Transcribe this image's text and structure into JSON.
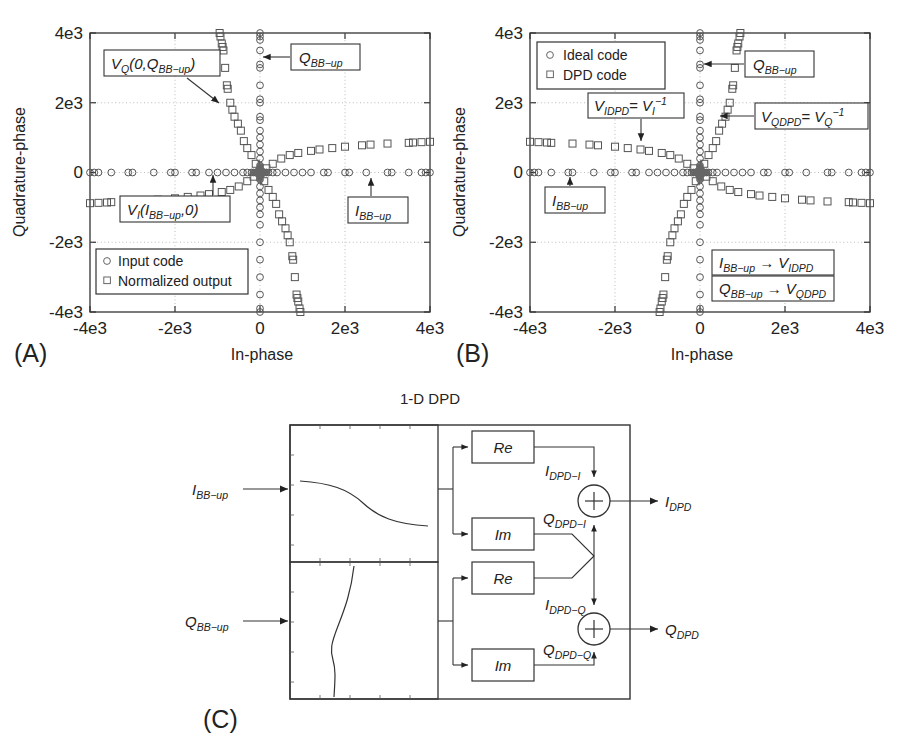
{
  "figure": {
    "background": "#ffffff",
    "line_color": "#333333",
    "marker_color": "#555555",
    "cluster_color": "#666666"
  },
  "panelA": {
    "label": "(A)",
    "xlabel": "In-phase",
    "ylabel": "Quadrature-phase",
    "xticks": [
      "-4e3",
      "-2e3",
      "0",
      "2e3",
      "4e3"
    ],
    "yticks": [
      "4e3",
      "2e3",
      "0",
      "-2e3",
      "-4e3"
    ],
    "legend": [
      {
        "marker": "circle",
        "label": "Input code"
      },
      {
        "marker": "square",
        "label": "Normalized output"
      }
    ],
    "annotations": [
      {
        "name": "vq-annotation",
        "text_parts": [
          "V",
          "Q",
          "(0,Q",
          "BB−up",
          ")"
        ]
      },
      {
        "name": "qbbup-annotation",
        "text_parts": [
          "Q",
          "BB−up"
        ]
      },
      {
        "name": "vi-annotation",
        "text_parts": [
          "V",
          "I",
          "(I",
          "BB−up",
          ",0)"
        ]
      },
      {
        "name": "ibbup-annotation",
        "text_parts": [
          "I",
          "BB−up"
        ]
      }
    ]
  },
  "panelB": {
    "label": "(B)",
    "xlabel": "In-phase",
    "ylabel": "Quadrature-phase",
    "xticks": [
      "-4e3",
      "-2e3",
      "0",
      "2e3",
      "4e3"
    ],
    "yticks": [
      "4e3",
      "2e3",
      "0",
      "-2e3",
      "-4e3"
    ],
    "legend": [
      {
        "marker": "circle",
        "label": "Ideal code"
      },
      {
        "marker": "square",
        "label": "DPD code"
      }
    ],
    "annotations": [
      {
        "name": "qbbup-annotation",
        "text_parts": [
          "Q",
          "BB−up"
        ]
      },
      {
        "name": "vidpd-annotation",
        "text_parts": [
          "V",
          "IDPD",
          " = V",
          "I",
          "−1"
        ]
      },
      {
        "name": "vqdpd-annotation",
        "text_parts": [
          "V",
          "QDPD",
          " = V",
          "Q",
          "−1"
        ]
      },
      {
        "name": "ibbup-annotation",
        "text_parts": [
          "I",
          "BB−up"
        ]
      },
      {
        "name": "map-i-annotation",
        "text_parts": [
          "I",
          "BB−up",
          " → V",
          "IDPD"
        ]
      },
      {
        "name": "map-q-annotation",
        "text_parts": [
          "Q",
          "BB−up",
          " → V",
          "QDPD"
        ]
      }
    ]
  },
  "panelC": {
    "label": "(C)",
    "title": "1-D DPD",
    "inputs": [
      {
        "name": "input-i",
        "base": "I",
        "sub": "BB−up"
      },
      {
        "name": "input-q",
        "base": "Q",
        "sub": "BB−up"
      }
    ],
    "blocks": [
      {
        "name": "re-block-1",
        "label": "Re"
      },
      {
        "name": "im-block-1",
        "label": "Im"
      },
      {
        "name": "re-block-2",
        "label": "Re"
      },
      {
        "name": "im-block-2",
        "label": "Im"
      }
    ],
    "wire_labels": [
      {
        "name": "wire-idpd-i",
        "base": "I",
        "sub": "DPD−I"
      },
      {
        "name": "wire-qdpd-i",
        "base": "Q",
        "sub": "DPD−I"
      },
      {
        "name": "wire-idpd-q",
        "base": "I",
        "sub": "DPD−Q"
      },
      {
        "name": "wire-qdpd-q",
        "base": "Q",
        "sub": "DPD−Q"
      }
    ],
    "adders": [
      {
        "name": "adder-i",
        "symbol": "+"
      },
      {
        "name": "adder-q",
        "symbol": "+"
      }
    ],
    "outputs": [
      {
        "name": "output-i",
        "base": "I",
        "sub": "DPD"
      },
      {
        "name": "output-q",
        "base": "Q",
        "sub": "DPD"
      }
    ]
  },
  "chart_data": [
    {
      "type": "scatter",
      "panel": "A",
      "title": "",
      "xlabel": "In-phase",
      "ylabel": "Quadrature-phase",
      "xlim": [
        -4000,
        4000
      ],
      "ylim": [
        -4000,
        4000
      ],
      "grid": true,
      "legend_position": "lower-left",
      "series": [
        {
          "name": "Input code",
          "marker": "circle",
          "description": "Ideal constellation codes lying exactly on the I axis (y=0) and on the Q axis (x=0), plus a dense cluster at the origin.",
          "x": [
            -4000,
            -3900,
            -3800,
            -3500,
            -3100,
            -3000,
            -2500,
            -2100,
            -2000,
            -1600,
            -1500,
            -1200,
            -1000,
            -800,
            -600,
            -400,
            -300,
            -200,
            -150,
            -100,
            -60,
            -30,
            0,
            30,
            60,
            100,
            150,
            200,
            300,
            400,
            600,
            800,
            1000,
            1200,
            1500,
            1600,
            2000,
            2100,
            2500,
            3000,
            3100,
            3500,
            3800,
            3900,
            4000
          ],
          "y": [
            0,
            0,
            0,
            0,
            0,
            0,
            0,
            0,
            0,
            0,
            0,
            0,
            0,
            0,
            0,
            0,
            0,
            0,
            0,
            0,
            0,
            0,
            0,
            0,
            0,
            0,
            0,
            0,
            0,
            0,
            0,
            0,
            0,
            0,
            0,
            0,
            0,
            0,
            0,
            0,
            0,
            0,
            0,
            0,
            0
          ]
        },
        {
          "name": "Input code (Q axis)",
          "marker": "circle",
          "x": [
            0,
            0,
            0,
            0,
            0,
            0,
            0,
            0,
            0,
            0,
            0,
            0,
            0,
            0,
            0,
            0,
            0,
            0,
            0,
            0,
            0,
            0,
            0,
            0,
            0,
            0,
            0,
            0,
            0,
            0,
            0,
            0
          ],
          "y": [
            4000,
            3900,
            3800,
            3500,
            3100,
            3000,
            2500,
            2100,
            2000,
            1600,
            1500,
            1200,
            1000,
            800,
            600,
            400,
            200,
            100,
            -100,
            -200,
            -400,
            -600,
            -800,
            -1000,
            -1200,
            -1500,
            -2000,
            -2500,
            -3000,
            -3500,
            -3900,
            -4000
          ]
        },
        {
          "name": "Normalized output",
          "marker": "square",
          "description": "Distorted/normalized output forms two skewed branches: an I-branch tilted upward to the right (positive slope ~0.22) and a Q-branch tilted to the right going down (rotated about 20 deg from the Q axis).",
          "x": [
            -4000,
            -3800,
            -3600,
            -3500,
            -3000,
            -2600,
            -2400,
            -2000,
            -1700,
            -1400,
            -1200,
            -900,
            -700,
            -500,
            -300,
            -150,
            150,
            300,
            500,
            700,
            900,
            1200,
            1400,
            1700,
            2000,
            2400,
            2600,
            3000,
            3500,
            3600,
            3800,
            4000
          ],
          "y": [
            -880,
            -870,
            -860,
            -850,
            -830,
            -800,
            -780,
            -740,
            -700,
            -660,
            -620,
            -560,
            -500,
            -400,
            -250,
            -120,
            120,
            250,
            400,
            500,
            560,
            620,
            660,
            700,
            740,
            780,
            800,
            830,
            850,
            860,
            870,
            880
          ]
        },
        {
          "name": "Normalized output (Q branch)",
          "marker": "square",
          "x": [
            -950,
            -930,
            -900,
            -880,
            -860,
            -820,
            -780,
            -760,
            -700,
            -650,
            -600,
            -520,
            -450,
            -380,
            -300,
            -200,
            -100,
            100,
            200,
            300,
            380,
            450,
            520,
            600,
            650,
            700,
            760,
            780,
            820,
            860,
            880,
            900,
            930,
            950
          ],
          "y": [
            4000,
            3900,
            3700,
            3600,
            3500,
            3000,
            2500,
            2400,
            2000,
            1800,
            1600,
            1400,
            1200,
            900,
            700,
            500,
            250,
            -250,
            -500,
            -700,
            -900,
            -1200,
            -1400,
            -1600,
            -1800,
            -2000,
            -2400,
            -2500,
            -3000,
            -3500,
            -3600,
            -3700,
            -3900,
            -4000
          ]
        }
      ]
    },
    {
      "type": "scatter",
      "panel": "B",
      "title": "",
      "xlabel": "In-phase",
      "ylabel": "Quadrature-phase",
      "xlim": [
        -4000,
        4000
      ],
      "ylim": [
        -4000,
        4000
      ],
      "grid": true,
      "legend_position": "upper-left",
      "series": [
        {
          "name": "Ideal code",
          "marker": "circle",
          "description": "Same ideal constellation: points on the I axis and Q axis with a dense origin cluster.",
          "x": [
            -4000,
            -3900,
            -3800,
            -3500,
            -3100,
            -3000,
            -2500,
            -2100,
            -2000,
            -1600,
            -1500,
            -1200,
            -1000,
            -800,
            -600,
            -400,
            -300,
            -200,
            -150,
            -100,
            -60,
            -30,
            0,
            30,
            60,
            100,
            150,
            200,
            300,
            400,
            600,
            800,
            1000,
            1200,
            1500,
            1600,
            2000,
            2100,
            2500,
            3000,
            3100,
            3500,
            3800,
            3900,
            4000
          ],
          "y": [
            0,
            0,
            0,
            0,
            0,
            0,
            0,
            0,
            0,
            0,
            0,
            0,
            0,
            0,
            0,
            0,
            0,
            0,
            0,
            0,
            0,
            0,
            0,
            0,
            0,
            0,
            0,
            0,
            0,
            0,
            0,
            0,
            0,
            0,
            0,
            0,
            0,
            0,
            0,
            0,
            0,
            0,
            0,
            0,
            0
          ]
        },
        {
          "name": "Ideal code (Q axis)",
          "marker": "circle",
          "x": [
            0,
            0,
            0,
            0,
            0,
            0,
            0,
            0,
            0,
            0,
            0,
            0,
            0,
            0,
            0,
            0,
            0,
            0,
            0,
            0,
            0,
            0,
            0,
            0,
            0,
            0,
            0,
            0,
            0,
            0,
            0,
            0
          ],
          "y": [
            4000,
            3900,
            3800,
            3500,
            3100,
            3000,
            2500,
            2100,
            2000,
            1600,
            1500,
            1200,
            1000,
            800,
            600,
            400,
            200,
            100,
            -100,
            -200,
            -400,
            -600,
            -800,
            -1000,
            -1200,
            -1500,
            -2000,
            -2500,
            -3000,
            -3500,
            -3900,
            -4000
          ]
        },
        {
          "name": "DPD code",
          "marker": "square",
          "description": "Pre-distorted codes: the I branch is tilted the opposite way from panel A (negative slope, up on the left, down on the right).",
          "x": [
            -4000,
            -3800,
            -3600,
            -3500,
            -3000,
            -2600,
            -2400,
            -2000,
            -1700,
            -1400,
            -1200,
            -900,
            -700,
            -500,
            -300,
            -150,
            150,
            300,
            500,
            700,
            900,
            1200,
            1400,
            1700,
            2000,
            2400,
            2600,
            3000,
            3500,
            3600,
            3800,
            4000
          ],
          "y": [
            880,
            870,
            860,
            850,
            830,
            800,
            780,
            740,
            700,
            660,
            620,
            560,
            500,
            400,
            250,
            120,
            -120,
            -250,
            -400,
            -500,
            -560,
            -620,
            -660,
            -700,
            -740,
            -780,
            -800,
            -830,
            -850,
            -860,
            -870,
            -880
          ]
        },
        {
          "name": "DPD code (Q branch)",
          "marker": "square",
          "x": [
            950,
            930,
            900,
            880,
            860,
            820,
            780,
            760,
            700,
            650,
            600,
            520,
            450,
            380,
            300,
            200,
            100,
            -100,
            -200,
            -300,
            -380,
            -450,
            -520,
            -600,
            -650,
            -700,
            -760,
            -780,
            -820,
            -860,
            -880,
            -900,
            -930,
            -950
          ],
          "y": [
            4000,
            3900,
            3700,
            3600,
            3500,
            3000,
            2500,
            2400,
            2000,
            1800,
            1600,
            1400,
            1200,
            900,
            700,
            500,
            250,
            -250,
            -500,
            -700,
            -900,
            -1200,
            -1400,
            -1600,
            -1800,
            -2000,
            -2400,
            -2500,
            -3000,
            -3500,
            -3600,
            -3700,
            -3900,
            -4000
          ]
        }
      ]
    },
    {
      "type": "line",
      "panel": "C-top",
      "title": "",
      "description": "Inset LUT characteristic for the I path: a monotonically decreasing S-shaped curve drawn left to right inside a framed box.",
      "x": [
        0,
        0.1,
        0.2,
        0.3,
        0.4,
        0.5,
        0.6,
        0.7,
        0.8,
        0.9,
        1.0
      ],
      "y": [
        0.8,
        0.79,
        0.77,
        0.73,
        0.65,
        0.55,
        0.46,
        0.4,
        0.37,
        0.36,
        0.355
      ]
    },
    {
      "type": "line",
      "panel": "C-bottom",
      "title": "",
      "description": "Inset LUT characteristic for the Q path: a vertical S-shaped curve drawn top to bottom inside a framed box.",
      "x": [
        0.52,
        0.5,
        0.47,
        0.43,
        0.38,
        0.34,
        0.33,
        0.335,
        0.34,
        0.345,
        0.35
      ],
      "y": [
        0.0,
        0.12,
        0.26,
        0.4,
        0.52,
        0.62,
        0.72,
        0.82,
        0.9,
        0.96,
        1.0
      ]
    }
  ]
}
